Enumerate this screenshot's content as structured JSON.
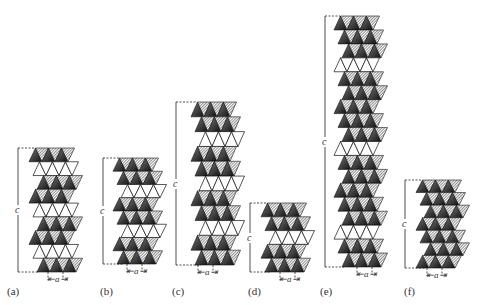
{
  "figure": {
    "axis_c_label": "c",
    "axis_a_label": "a",
    "panels": [
      {
        "id": "a",
        "label": "(a)",
        "top": 148,
        "bottom": 272,
        "x": 33,
        "cell_left": 18,
        "a_x": 48,
        "layers": [
          "d",
          "w",
          "d",
          "d",
          "w",
          "d",
          "d",
          "w",
          "d"
        ]
      },
      {
        "id": "b",
        "label": "(b)",
        "top": 158,
        "bottom": 264,
        "x": 117,
        "cell_left": 103,
        "a_x": 127,
        "layers": [
          "d",
          "d",
          "w",
          "d",
          "d",
          "w",
          "d",
          "d"
        ]
      },
      {
        "id": "c",
        "label": "(c)",
        "top": 102,
        "bottom": 265,
        "x": 195,
        "cell_left": 176,
        "a_x": 198,
        "layers": [
          "d",
          "d",
          "w",
          "d",
          "d",
          "w",
          "d",
          "d",
          "w",
          "d",
          "d"
        ]
      },
      {
        "id": "d",
        "label": "(d)",
        "top": 203,
        "bottom": 272,
        "x": 265,
        "cell_left": 250,
        "a_x": 280,
        "layers": [
          "d",
          "d",
          "w",
          "d",
          "d"
        ]
      },
      {
        "id": "e",
        "label": "(e)",
        "top": 16,
        "bottom": 267,
        "x": 338,
        "cell_left": 325,
        "a_x": 357,
        "layers": [
          "d",
          "d",
          "d",
          "w",
          "d",
          "d",
          "d",
          "d",
          "d",
          "w",
          "d",
          "d",
          "d",
          "d",
          "d",
          "w",
          "d",
          "d"
        ]
      },
      {
        "id": "f",
        "label": "(f)",
        "top": 180,
        "bottom": 268,
        "x": 420,
        "cell_left": 405,
        "a_x": 427,
        "layers": [
          "d",
          "d",
          "d",
          "d",
          "d",
          "d",
          "d"
        ]
      }
    ]
  },
  "labels": {
    "a": "(a)",
    "b": "(b)",
    "c": "(c)",
    "d": "(d)",
    "e": "(e)",
    "f": "(f)",
    "c_axis": "c",
    "a_axis": "a"
  }
}
